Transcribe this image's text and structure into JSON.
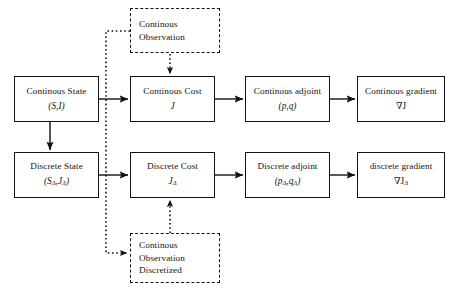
{
  "diagram": {
    "background_color": "#ffffff",
    "line_color": "#111111",
    "text_color": "#141414"
  },
  "nodes": {
    "continuous_state": {
      "label": "Continous State",
      "symbol": "(S,I)",
      "style": "solid"
    },
    "continuous_cost": {
      "label": "Continous Cost",
      "symbol": "J",
      "style": "solid"
    },
    "continuous_adjoint": {
      "label": "Continous adjoint",
      "symbol": "(p,q)",
      "style": "solid"
    },
    "continuous_gradient": {
      "label": "Continous gradient",
      "symbol": "∇J",
      "style": "solid"
    },
    "discrete_state": {
      "label": "Discrete State",
      "symbol_main": "(S",
      "symbol_sub1": "Δ",
      "symbol_mid": ",J",
      "symbol_sub2": "Δ",
      "symbol_end": ")",
      "style": "solid"
    },
    "discrete_cost": {
      "label": "Discrete Cost",
      "symbol_main": "J",
      "symbol_sub1": "Δ",
      "style": "solid"
    },
    "discrete_adjoint": {
      "label": "Discrete adjoint",
      "symbol_main": "(p",
      "symbol_sub1": "Δ",
      "symbol_mid": ",q",
      "symbol_sub2": "Δ",
      "symbol_end": ")",
      "style": "solid"
    },
    "discrete_gradient": {
      "label": "discrete gradient",
      "symbol_main": "∇J",
      "symbol_sub1": "Δ",
      "style": "solid"
    },
    "continuous_observation": {
      "line1": "Continous",
      "line2": "Observation",
      "style": "dashed"
    },
    "continuous_observation_discretized": {
      "line1": "Continous",
      "line2": "Observation",
      "line3": "Discretized",
      "style": "dashed"
    }
  },
  "edges": [
    {
      "name": "state-to-cost-continuous",
      "from": "continuous_state",
      "to": "continuous_cost",
      "style": "solid",
      "direction": "right"
    },
    {
      "name": "cost-to-adjoint-continuous",
      "from": "continuous_cost",
      "to": "continuous_adjoint",
      "style": "solid",
      "direction": "right"
    },
    {
      "name": "adjoint-to-gradient-continuous",
      "from": "continuous_adjoint",
      "to": "continuous_gradient",
      "style": "solid",
      "direction": "right"
    },
    {
      "name": "state-to-cost-discrete",
      "from": "discrete_state",
      "to": "discrete_cost",
      "style": "solid",
      "direction": "right"
    },
    {
      "name": "cost-to-adjoint-discrete",
      "from": "discrete_cost",
      "to": "discrete_adjoint",
      "style": "solid",
      "direction": "right"
    },
    {
      "name": "adjoint-to-gradient-discrete",
      "from": "discrete_adjoint",
      "to": "discrete_gradient",
      "style": "solid",
      "direction": "right"
    },
    {
      "name": "continuous-state-to-discrete-state",
      "from": "continuous_state",
      "to": "discrete_state",
      "style": "solid",
      "direction": "down"
    },
    {
      "name": "observation-to-continuous-cost",
      "from": "continuous_observation",
      "to": "continuous_cost",
      "style": "dotted",
      "direction": "down"
    },
    {
      "name": "discretized-observation-to-discrete-cost",
      "from": "continuous_observation_discretized",
      "to": "discrete_cost",
      "style": "dotted",
      "direction": "up"
    },
    {
      "name": "observation-to-discretized-observation",
      "from": "continuous_observation",
      "to": "continuous_observation_discretized",
      "style": "dotted",
      "direction": "down-right"
    }
  ]
}
